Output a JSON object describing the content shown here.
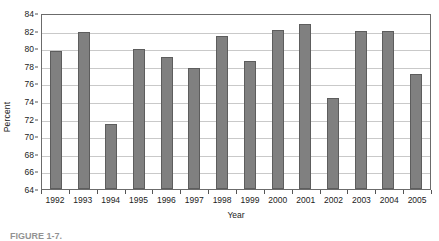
{
  "chart_data": {
    "type": "bar",
    "title": "",
    "xlabel": "Year",
    "ylabel": "Percent",
    "categories": [
      "1992",
      "1993",
      "1994",
      "1995",
      "1996",
      "1997",
      "1998",
      "1999",
      "2000",
      "2001",
      "2002",
      "2003",
      "2004",
      "2005"
    ],
    "values": [
      79.7,
      81.8,
      71.4,
      79.9,
      79.0,
      77.8,
      81.4,
      78.6,
      82.1,
      82.7,
      74.3,
      82.0,
      82.0,
      77.1
    ],
    "ylim": [
      64,
      84
    ],
    "ytick_values": [
      64,
      66,
      68,
      70,
      72,
      74,
      76,
      78,
      80,
      82,
      84
    ],
    "ytick_labels": [
      "64",
      "66",
      "68",
      "70",
      "72",
      "74",
      "76",
      "78",
      "80",
      "82",
      "84"
    ],
    "grid": true,
    "legend": false,
    "legend_position": "none",
    "series": [
      {
        "name": "Percent",
        "values": [
          79.7,
          81.8,
          71.4,
          79.9,
          79.0,
          77.8,
          81.4,
          78.6,
          82.1,
          82.7,
          74.3,
          82.0,
          82.0,
          77.1
        ]
      }
    ],
    "colors": {
      "bar_fill": "#808080",
      "bar_edge": "#5d5d5d",
      "gridline": "#c9c9c9",
      "axis": "#6b6b6b",
      "background": "#ffffff",
      "text": "#222222"
    }
  },
  "caption": {
    "text": "FIGURE 1-7."
  }
}
